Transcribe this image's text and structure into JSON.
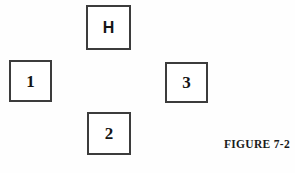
{
  "figure": {
    "caption": "FIGURE 7-2",
    "background_color": "#fefefe",
    "border_color": "#3c3c3c",
    "text_color": "#151515",
    "width": 295,
    "height": 173
  },
  "nodes": [
    {
      "id": "h",
      "label": "H",
      "position": "top-center",
      "x": 86,
      "y": 5,
      "width": 45,
      "height": 45
    },
    {
      "id": "1",
      "label": "1",
      "position": "left",
      "x": 9,
      "y": 60,
      "width": 43,
      "height": 42
    },
    {
      "id": "3",
      "label": "3",
      "position": "right",
      "x": 165,
      "y": 62,
      "width": 43,
      "height": 41
    },
    {
      "id": "2",
      "label": "2",
      "position": "bottom-center",
      "x": 87,
      "y": 112,
      "width": 44,
      "height": 43
    }
  ]
}
